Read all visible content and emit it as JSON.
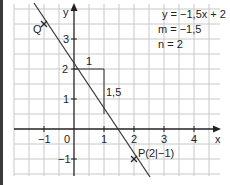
{
  "diagram": {
    "type": "linear-function-graph",
    "equation": "y = −1,5x + 2",
    "slope_label": "m = −1,5",
    "intercept_label": "n = 2",
    "axes": {
      "x_label": "x",
      "y_label": "y",
      "x_ticks": [
        "−1",
        "0",
        "1",
        "2",
        "3",
        "4"
      ],
      "y_ticks": [
        "−1",
        "1",
        "2",
        "3"
      ]
    },
    "slope_triangle": {
      "run_label": "1",
      "rise_label": "1,5"
    },
    "points": [
      {
        "name": "Q",
        "label": "Q"
      },
      {
        "name": "P",
        "label": "P(2|−1)"
      }
    ],
    "colors": {
      "grid": "#c8c8c8",
      "axis": "#222222",
      "line": "#333333",
      "border": "#3a3a3a"
    }
  }
}
